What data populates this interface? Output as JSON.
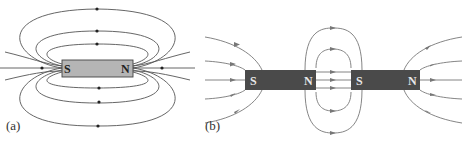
{
  "panel_a": {
    "label": "(a)",
    "magnet": {
      "left_pole": "S",
      "right_pole": "N",
      "fill": "#b5b5b5"
    },
    "field_line_color": "#555555"
  },
  "panel_b": {
    "label": "(b)",
    "magnet_left": {
      "left_pole": "S",
      "right_pole": "N",
      "fill": "#4a4a4a"
    },
    "magnet_right": {
      "left_pole": "S",
      "right_pole": "N",
      "fill": "#4a4a4a"
    },
    "field_line_color": "#777777"
  }
}
